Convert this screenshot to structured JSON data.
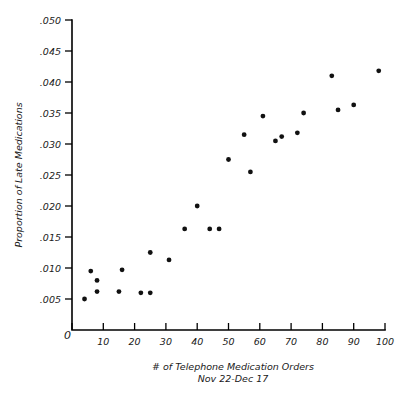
{
  "chart_data": {
    "type": "scatter",
    "title": "",
    "xlabel": "# of Telephone Medication Orders",
    "xlabel_sub": "Nov 22-Dec 17",
    "ylabel": "Proportion of Late Medications",
    "xlim": [
      0,
      100
    ],
    "ylim": [
      0,
      0.05
    ],
    "grid": false,
    "legend": false,
    "origin_label": "0",
    "x_ticks": [
      0,
      10,
      20,
      30,
      40,
      50,
      60,
      70,
      80,
      90,
      100
    ],
    "x_tick_labels": [
      "",
      "10",
      "20",
      "30",
      "40",
      "50",
      "60",
      "70",
      "80",
      "90",
      "100"
    ],
    "y_ticks": [
      0.005,
      0.01,
      0.015,
      0.02,
      0.025,
      0.03,
      0.035,
      0.04,
      0.045,
      0.05
    ],
    "y_tick_labels": [
      ".005",
      ".010",
      ".015",
      ".020",
      ".025",
      ".030",
      ".035",
      ".040",
      ".045",
      ".050"
    ],
    "marker_color": "#111111",
    "marker_size": 2.4,
    "points": [
      {
        "x": 4,
        "y": 0.005
      },
      {
        "x": 6,
        "y": 0.0095
      },
      {
        "x": 8,
        "y": 0.008
      },
      {
        "x": 8,
        "y": 0.0062
      },
      {
        "x": 15,
        "y": 0.0062
      },
      {
        "x": 16,
        "y": 0.0097
      },
      {
        "x": 22,
        "y": 0.006
      },
      {
        "x": 25,
        "y": 0.006
      },
      {
        "x": 25,
        "y": 0.0125
      },
      {
        "x": 31,
        "y": 0.0113
      },
      {
        "x": 36,
        "y": 0.0163
      },
      {
        "x": 40,
        "y": 0.02
      },
      {
        "x": 44,
        "y": 0.0163
      },
      {
        "x": 47,
        "y": 0.0163
      },
      {
        "x": 50,
        "y": 0.0275
      },
      {
        "x": 55,
        "y": 0.0315
      },
      {
        "x": 57,
        "y": 0.0255
      },
      {
        "x": 61,
        "y": 0.0345
      },
      {
        "x": 65,
        "y": 0.0305
      },
      {
        "x": 67,
        "y": 0.0312
      },
      {
        "x": 72,
        "y": 0.0318
      },
      {
        "x": 74,
        "y": 0.035
      },
      {
        "x": 83,
        "y": 0.041
      },
      {
        "x": 85,
        "y": 0.0355
      },
      {
        "x": 90,
        "y": 0.0363
      },
      {
        "x": 98,
        "y": 0.0418
      }
    ]
  },
  "axes_geometry": {
    "x0_px": 72,
    "x100_px": 385,
    "y0_px": 330,
    "ytop_px": 20,
    "ytop_value": 0.05
  }
}
